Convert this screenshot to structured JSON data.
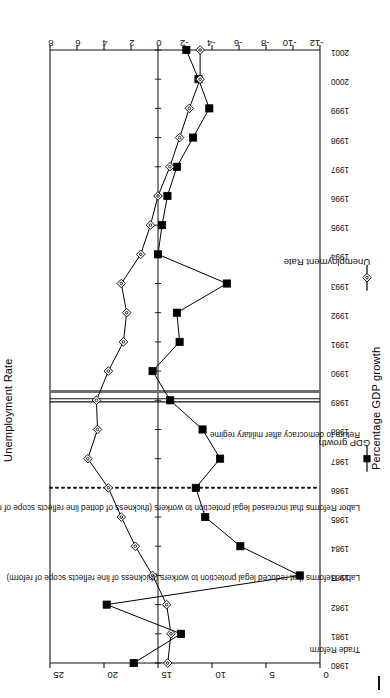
{
  "figure": {
    "caption_mark": "—"
  },
  "chart_data": {
    "type": "line",
    "title": "",
    "orientation": "rotated-90-ccw",
    "x": [
      1980,
      1981,
      1982,
      1983,
      1984,
      1985,
      1986,
      1987,
      1988,
      1989,
      1990,
      1991,
      1992,
      1993,
      1994,
      1995,
      1996,
      1997,
      1998,
      1999,
      2000,
      2001
    ],
    "xlabel": "",
    "xtick_labels": [
      "1980",
      "1981",
      "1982",
      "1983",
      "1984",
      "1985",
      "1986",
      "1987",
      "1988",
      "1989",
      "1990",
      "1991",
      "1992",
      "1993",
      "1994",
      "1995",
      "1996",
      "1997",
      "1998",
      "1999",
      "2000",
      "2001"
    ],
    "grid": false,
    "legend_position": "below-axis",
    "axes": [
      {
        "id": "gdp",
        "label": "Percentage GDP growth",
        "position": "bottom",
        "lim": [
          8,
          -12
        ],
        "ticks": [
          8,
          6,
          4,
          2,
          0,
          -2,
          -4,
          -6,
          -8,
          -10,
          -12
        ],
        "tick_labels": [
          "8",
          "6",
          "4",
          "2",
          "0",
          "-2",
          "-4",
          "-6",
          "-8",
          "-10",
          "-12"
        ]
      },
      {
        "id": "unemployment",
        "label": "Unemployment Rate",
        "position": "top",
        "lim": [
          25,
          0
        ],
        "ticks": [
          25,
          20,
          15,
          10,
          5,
          0
        ],
        "tick_labels": [
          "25",
          "20",
          "15",
          "10",
          "5",
          "0"
        ]
      }
    ],
    "series": [
      {
        "name": "GDP growth",
        "axis": "gdp",
        "marker": "filled-square",
        "color": "#000000",
        "values": [
          1.8,
          -1.7,
          3.8,
          -10.5,
          -6.1,
          -3.5,
          -2.8,
          -4.6,
          -3.3,
          -0.9,
          0.4,
          -1.6,
          -1.4,
          -5.1,
          0.0,
          -0.3,
          -0.7,
          -1.4,
          -2.6,
          -3.8,
          -3.0,
          -2.1
        ]
      },
      {
        "name": "Unemployment Rate",
        "axis": "unemployment",
        "marker": "open-diamond",
        "color": "#000000",
        "values": [
          14.1,
          13.8,
          14.2,
          15.5,
          17.1,
          18.4,
          19.6,
          21.5,
          20.6,
          20.7,
          19.6,
          18.2,
          17.9,
          18.4,
          16.6,
          15.7,
          15.0,
          13.9,
          13.0,
          12.1,
          11.1,
          11.1
        ]
      }
    ],
    "event_markers": [
      {
        "name": "Trade Reform",
        "year": 1989,
        "style": "double-line"
      },
      {
        "name": "Labor Reforms that reduced legal protection to workers",
        "year": 1989.3,
        "style": "thick-line"
      },
      {
        "name": "Labor Reforms that increased legal protection to workers",
        "year": 1986,
        "style": "dotted-line"
      },
      {
        "name": "Return to democracy after military regime",
        "year": null,
        "style": "dash-dot-line"
      }
    ],
    "legend": {
      "series_entries": [
        {
          "label": "GDP growth",
          "marker": "filled-square"
        },
        {
          "label": "Unemployment Rate",
          "marker": "open-diamond"
        }
      ],
      "event_entries": [
        {
          "label": "Trade Reform",
          "style": "double-line"
        },
        {
          "label": "Labor Reforms that reduced legal protection to workers (thickness of line reflects scope of reform)",
          "style": "thick-line"
        },
        {
          "label": "Labor Reforms that increased legal protection to workers (thickness of dotted line reflects scope of reform)",
          "style": "dotted-line"
        },
        {
          "label": "Return to democracy after military regime",
          "style": "dash-dot-line"
        }
      ]
    }
  }
}
